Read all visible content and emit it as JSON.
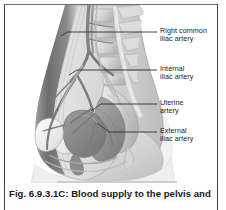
{
  "figure": {
    "caption": "Fig. 6.9.3.1C: Blood supply to the pelvis and",
    "alt_title": "Sagittal section of the female pelvis showing arterial blood supply",
    "labels": [
      {
        "id": "right-common-iliac-artery",
        "line1": "Right common",
        "line2": "iliac artery"
      },
      {
        "id": "internal-iliac-artery",
        "line1": "Internal",
        "line2": "iliac artery"
      },
      {
        "id": "uterine-artery",
        "line1": "Uterine",
        "line2": "artery"
      },
      {
        "id": "external-iliac-artery",
        "line1": "External",
        "line2": "iliac artery"
      }
    ]
  },
  "colors": {
    "frame_rule": "#3d3d3d",
    "caption_text": "#1a1a1a",
    "label_text": "#1d1d1d",
    "leader_line": "#2b2b2b",
    "body_outline": "#8d8d8d",
    "abdominal_wall_dark": "#6a6a6a",
    "bone_light": "#d9d9d9",
    "organ_mid": "#9a9a9a",
    "background": "#ffffff"
  }
}
